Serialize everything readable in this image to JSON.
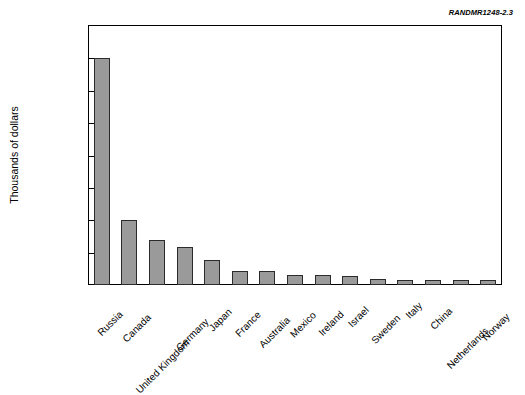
{
  "figure": {
    "source_id": "RANDMR1248-2.3"
  },
  "chart_data": {
    "type": "bar",
    "title": "",
    "xlabel": "",
    "ylabel": "Thousands of dollars",
    "ylim": [
      0,
      400000
    ],
    "ytick_values": [
      0,
      50000,
      100000,
      150000,
      200000,
      250000,
      300000,
      350000,
      400000
    ],
    "ytick_labels": [
      "0",
      "50,000",
      "100,000",
      "150,000",
      "200,000",
      "250,000",
      "300,000",
      "350,000",
      "400,000"
    ],
    "grid": false,
    "legend": null,
    "bar_color": "#9a9a9a",
    "bar_edge_color": "#2b2b2b",
    "categories": [
      "Russia",
      "Canada",
      "United Kingdom",
      "Germany",
      "Japan",
      "France",
      "Australia",
      "Mexico",
      "Ireland",
      "Israel",
      "Sweden",
      "Italy",
      "China",
      "Netherlands",
      "Norway"
    ],
    "values": [
      350000,
      100000,
      70000,
      58000,
      38000,
      22000,
      21000,
      16000,
      16000,
      14000,
      10000,
      7000,
      8000,
      8000,
      8000
    ]
  }
}
